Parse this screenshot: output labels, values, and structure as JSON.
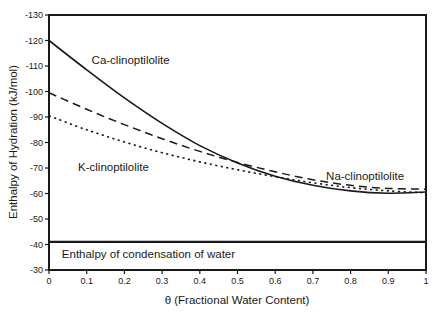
{
  "chart_data": {
    "type": "line",
    "title": "",
    "xlabel": "θ (Fractional Water Content)",
    "ylabel": "Enthalpy of Hydration (kJ/mol)",
    "xlim": [
      0,
      1
    ],
    "ylim": [
      -130,
      -30
    ],
    "y_axis_direction": "negative-up",
    "grid": false,
    "legend": "inline-labels",
    "x_ticks": [
      0,
      0.1,
      0.2,
      0.3,
      0.4,
      0.5,
      0.6,
      0.7,
      0.8,
      0.9,
      1
    ],
    "y_ticks": [
      -130,
      -120,
      -110,
      -100,
      -90,
      -80,
      -70,
      -60,
      -50,
      -40,
      -30
    ],
    "x": [
      0,
      0.1,
      0.2,
      0.3,
      0.4,
      0.5,
      0.6,
      0.7,
      0.8,
      0.9,
      1
    ],
    "series": [
      {
        "name": "Ca-clinoptilolite",
        "line_style": "solid",
        "values": [
          -120,
          -108.5,
          -97.5,
          -87.5,
          -78.8,
          -72,
          -66.8,
          -63.2,
          -61,
          -60.1,
          -60.6
        ]
      },
      {
        "name": "Na-clinoptilolite",
        "line_style": "dashed",
        "values": [
          -99.5,
          -93,
          -87,
          -81.5,
          -76.5,
          -72.2,
          -68.5,
          -65.4,
          -63.2,
          -62,
          -61.7
        ]
      },
      {
        "name": "K-clinoptilolite",
        "line_style": "dotted",
        "values": [
          -90.5,
          -85,
          -80.2,
          -76,
          -72.4,
          -69.3,
          -66.6,
          -64.2,
          -62.3,
          -61,
          -60.3
        ]
      }
    ],
    "reference_line": {
      "label": "Enthalpy of condensation of water",
      "value": -41
    },
    "annotations": [
      {
        "text": "Ca-clinoptilolite",
        "theta": 0.113,
        "value": -110.6
      },
      {
        "text": "K-clinoptilolite",
        "theta": 0.077,
        "value": -68.8
      },
      {
        "text": "Na-clinoptilolite",
        "theta": 0.735,
        "value": -65.3
      },
      {
        "text": "Enthalpy of condensation of water",
        "theta": 0.034,
        "value": -34.9
      }
    ],
    "colors": {
      "line": "#1a1a1a",
      "background": "#ffffff"
    }
  }
}
